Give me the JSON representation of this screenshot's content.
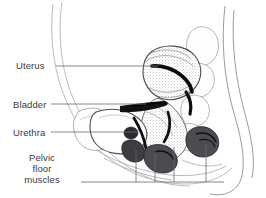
{
  "figure": {
    "type": "medical-illustration",
    "style": "grayscale line and stipple drawing",
    "width": 266,
    "height": 198,
    "background_color": "#ffffff",
    "line_color": "#55555a",
    "label_color": "#3a3a3a",
    "leader_color": "#6a6a70",
    "dark_tissue_color": "#111111",
    "mid_tissue_color": "#6f6f74",
    "light_tissue_color": "#b9b9bd"
  },
  "labels": {
    "uterus": "Uterus",
    "bladder": "Bladder",
    "urethra": "Urethra",
    "pelvic_floor_line1": "Pelvic",
    "pelvic_floor_line2": "floor",
    "pelvic_floor_line3": "muscles"
  },
  "leaders": [
    {
      "name": "uterus-leader",
      "x1": 56,
      "y1": 66,
      "x2": 158,
      "y2": 66
    },
    {
      "name": "bladder-leader",
      "x1": 51,
      "y1": 104,
      "x2": 146,
      "y2": 104
    },
    {
      "name": "urethra-leader",
      "x1": 51,
      "y1": 132,
      "x2": 138,
      "y2": 132
    },
    {
      "name": "pelvic-floor-leader",
      "x1": 81,
      "y1": 182,
      "x2": 224,
      "y2": 182
    }
  ],
  "pelvic_floor_risers": [
    {
      "name": "riser-1",
      "x": 136,
      "y_top": 150,
      "y_bottom": 182
    },
    {
      "name": "riser-2",
      "x": 155,
      "y_top": 150,
      "y_bottom": 182
    },
    {
      "name": "riser-3",
      "x": 174,
      "y_top": 147,
      "y_bottom": 182
    },
    {
      "name": "riser-4",
      "x": 206,
      "y_top": 144,
      "y_bottom": 182
    }
  ]
}
